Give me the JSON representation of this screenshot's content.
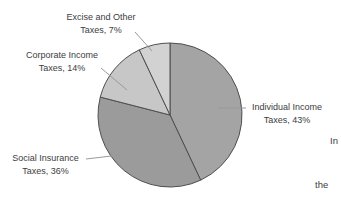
{
  "figure": {
    "background_color": "#ffffff",
    "text_color": "#3d3d3d",
    "leader_line_color": "#999999"
  },
  "chart_data": {
    "type": "pie",
    "title": "",
    "start_angle": "12-o-clock, clockwise",
    "center": {
      "x": 170,
      "y": 115
    },
    "radius": 72,
    "outline_color": "#4f4f4f",
    "slices": [
      {
        "id": "individual-income",
        "label_line1": "Individual Income",
        "label_line2": "Taxes, 43%",
        "category": "Individual Income Taxes",
        "percent": 43,
        "color": "#a4a4a4"
      },
      {
        "id": "social-insurance",
        "label_line1": "Social Insurance",
        "label_line2": "Taxes, 36%",
        "category": "Social Insurance Taxes",
        "percent": 36,
        "color": "#9b9b9b"
      },
      {
        "id": "corporate-income",
        "label_line1": "Corporate Income",
        "label_line2": "Taxes, 14%",
        "category": "Corporate Income Taxes",
        "percent": 14,
        "color": "#c7c7c7"
      },
      {
        "id": "excise-other",
        "label_line1": "Excise and Other",
        "label_line2": "Taxes, 7%",
        "category": "Excise and Other Taxes",
        "percent": 7,
        "color": "#d2d2d2"
      }
    ],
    "legend": "none",
    "labels_position": "outside-with-leader-lines"
  },
  "fragments": {
    "right_top": "In",
    "right_bottom": "the"
  }
}
